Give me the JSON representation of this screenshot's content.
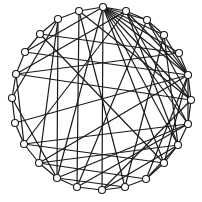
{
  "diagram": {
    "type": "circular-graph",
    "title": "",
    "layout": "circle",
    "center": [
      101,
      100
    ],
    "radius": 90,
    "node_radius": 3.5,
    "colors": {
      "edge": "#1a1a1a",
      "node_fill": "#ffffff",
      "node_stroke": "#1a1a1a",
      "background": "#ffffff"
    },
    "nodes": [
      {
        "id": 0,
        "x": 103,
        "y": 7
      },
      {
        "id": 1,
        "x": 126,
        "y": 11
      },
      {
        "id": 2,
        "x": 147,
        "y": 20
      },
      {
        "id": 3,
        "x": 164,
        "y": 35
      },
      {
        "id": 4,
        "x": 179,
        "y": 53
      },
      {
        "id": 5,
        "x": 188,
        "y": 75
      },
      {
        "id": 6,
        "x": 191,
        "y": 100
      },
      {
        "id": 7,
        "x": 188,
        "y": 124
      },
      {
        "id": 8,
        "x": 178,
        "y": 145
      },
      {
        "id": 9,
        "x": 164,
        "y": 163
      },
      {
        "id": 10,
        "x": 146,
        "y": 179
      },
      {
        "id": 11,
        "x": 125,
        "y": 187
      },
      {
        "id": 12,
        "x": 102,
        "y": 190
      },
      {
        "id": 13,
        "x": 77,
        "y": 187
      },
      {
        "id": 14,
        "x": 57,
        "y": 178
      },
      {
        "id": 15,
        "x": 39,
        "y": 163
      },
      {
        "id": 16,
        "x": 24,
        "y": 144
      },
      {
        "id": 17,
        "x": 15,
        "y": 123
      },
      {
        "id": 18,
        "x": 12,
        "y": 98
      },
      {
        "id": 19,
        "x": 16,
        "y": 74
      },
      {
        "id": 20,
        "x": 25,
        "y": 52
      },
      {
        "id": 21,
        "x": 40,
        "y": 34
      },
      {
        "id": 22,
        "x": 58,
        "y": 19
      },
      {
        "id": 23,
        "x": 79,
        "y": 11
      }
    ],
    "edges": [
      [
        0,
        1
      ],
      [
        0,
        2
      ],
      [
        0,
        3
      ],
      [
        0,
        4
      ],
      [
        0,
        5
      ],
      [
        0,
        6
      ],
      [
        0,
        7
      ],
      [
        0,
        8
      ],
      [
        0,
        9
      ],
      [
        0,
        23
      ],
      [
        0,
        20
      ],
      [
        0,
        14
      ],
      [
        0,
        12
      ],
      [
        1,
        2
      ],
      [
        1,
        5
      ],
      [
        1,
        7
      ],
      [
        1,
        8
      ],
      [
        1,
        16
      ],
      [
        2,
        3
      ],
      [
        2,
        5
      ],
      [
        2,
        6
      ],
      [
        2,
        13
      ],
      [
        3,
        5
      ],
      [
        3,
        8
      ],
      [
        3,
        11
      ],
      [
        4,
        5
      ],
      [
        4,
        19
      ],
      [
        4,
        21
      ],
      [
        5,
        6
      ],
      [
        5,
        7
      ],
      [
        5,
        9
      ],
      [
        5,
        10
      ],
      [
        5,
        17
      ],
      [
        5,
        20
      ],
      [
        5,
        15
      ],
      [
        6,
        7
      ],
      [
        6,
        19
      ],
      [
        6,
        12
      ],
      [
        7,
        8
      ],
      [
        7,
        13
      ],
      [
        7,
        14
      ],
      [
        7,
        16
      ],
      [
        8,
        9
      ],
      [
        8,
        10
      ],
      [
        8,
        12
      ],
      [
        8,
        15
      ],
      [
        9,
        10
      ],
      [
        9,
        16
      ],
      [
        9,
        21
      ],
      [
        10,
        11
      ],
      [
        10,
        15
      ],
      [
        11,
        12
      ],
      [
        11,
        14
      ],
      [
        12,
        13
      ],
      [
        13,
        14
      ],
      [
        13,
        23
      ],
      [
        14,
        15
      ],
      [
        14,
        18
      ],
      [
        15,
        16
      ],
      [
        15,
        22
      ],
      [
        16,
        17
      ],
      [
        16,
        19
      ],
      [
        17,
        18
      ],
      [
        18,
        19
      ],
      [
        18,
        22
      ],
      [
        19,
        20
      ],
      [
        19,
        1
      ],
      [
        20,
        21
      ],
      [
        21,
        22
      ],
      [
        22,
        23
      ],
      [
        22,
        14
      ],
      [
        23,
        11
      ],
      [
        23,
        6
      ]
    ]
  }
}
